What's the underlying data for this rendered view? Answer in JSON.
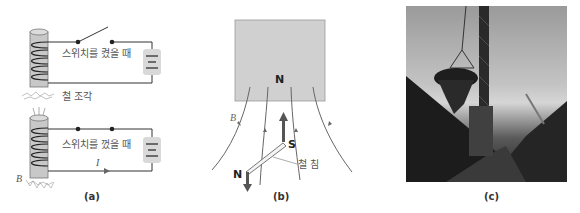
{
  "figure": {
    "panels": [
      {
        "id": "a",
        "caption": "(a)",
        "top_circuit": {
          "switch_label": "스위치를 켰을 때",
          "debris_label": "철 조각"
        },
        "bottom_circuit": {
          "switch_label": "스위치를 껐을 때",
          "current_label": "I",
          "field_label": "B"
        }
      },
      {
        "id": "b",
        "caption": "(b)",
        "magnet_pole": "N",
        "field_label": "B",
        "needle_south": "S",
        "needle_north": "N",
        "needle_label": "철 침"
      },
      {
        "id": "c",
        "caption": "(c)",
        "photo_description": "Crane electromagnet lifting scrap iron"
      }
    ]
  },
  "colors": {
    "wire": "#333333",
    "coil_core": "#c8c8c8",
    "battery_bg": "#d9d9d9",
    "magnet": "#d0d0d0",
    "field_line": "#666666",
    "arrow_dark": "#555555"
  }
}
